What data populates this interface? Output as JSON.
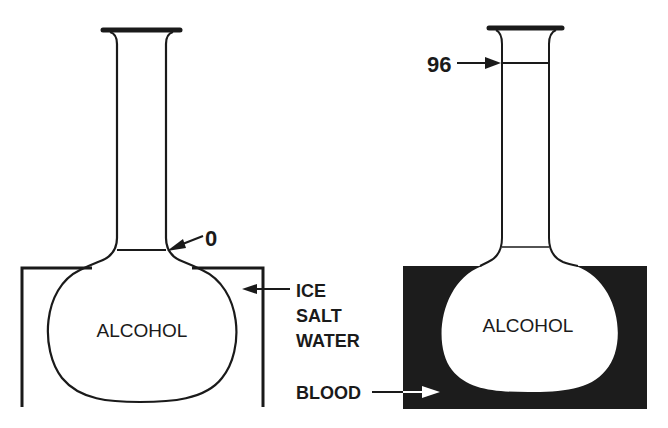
{
  "colors": {
    "ink": "#1a1a1a",
    "blood_fill": "#1c1c1c",
    "background": "#ffffff"
  },
  "left_panel": {
    "flask_label": "ALCOHOL",
    "mark_label": "0",
    "bath_label_lines": [
      "ICE",
      "SALT",
      "WATER"
    ]
  },
  "right_panel": {
    "flask_label": "ALCOHOL",
    "mark_label": "96",
    "bath_label": "BLOOD"
  }
}
